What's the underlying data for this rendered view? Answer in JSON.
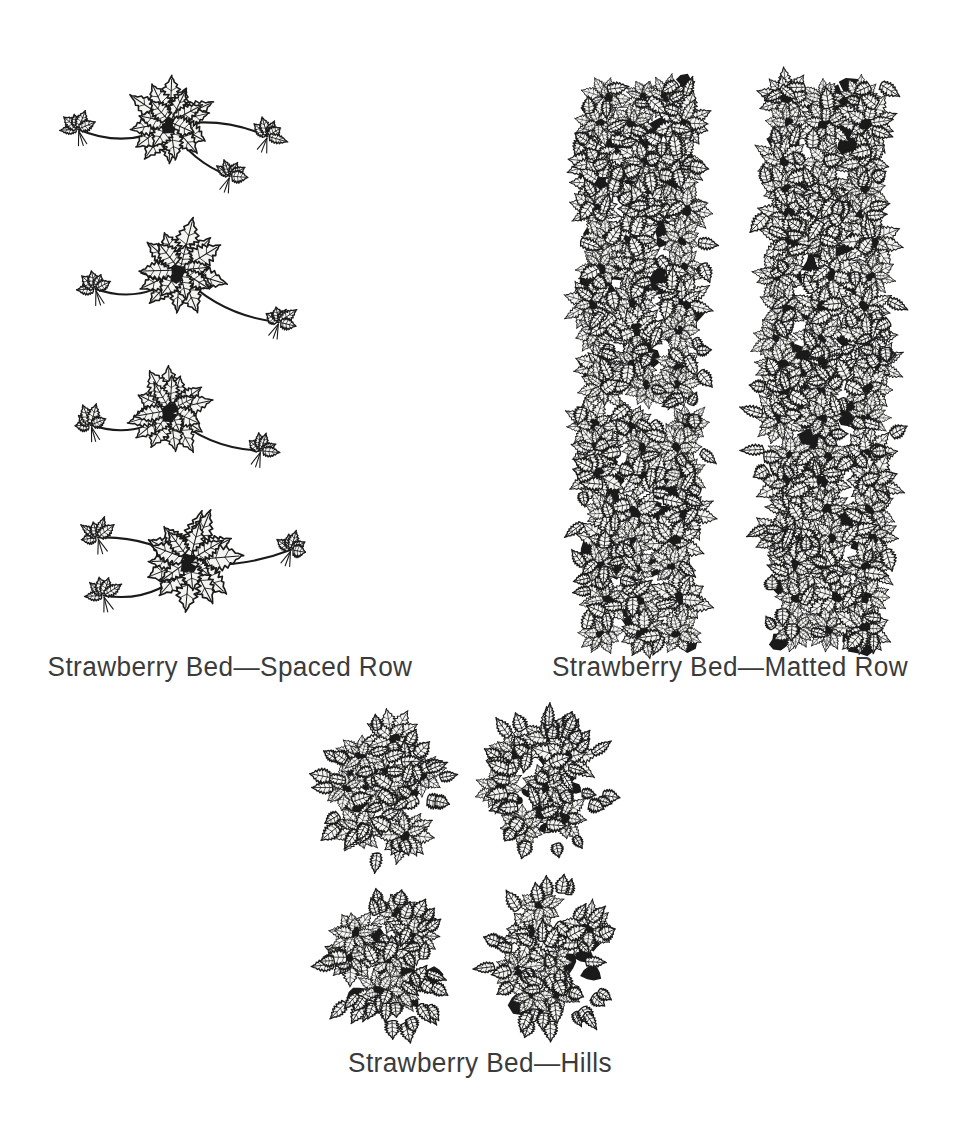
{
  "page": {
    "background_color": "#ffffff",
    "ink_color": "#1a1a1a",
    "text_color": "#3b3b3b",
    "type": "botanical-line-illustration"
  },
  "figures": [
    {
      "id": "spaced-row",
      "caption": "Strawberry Bed—Spaced Row",
      "layout": "vertical-column",
      "plant_count": 4,
      "description": "Four individual strawberry mother plants arranged in a vertical line, each with runners extending to small daughter plantlets",
      "plants": [
        {
          "cx": 110,
          "cy": 62,
          "scale": 1.0,
          "rot": -4,
          "runners": [
            {
              "angle": 178,
              "len": 92,
              "plantlet": 1,
              "bend": -22
            },
            {
              "angle": 6,
              "len": 98,
              "plantlet": 1,
              "bend": -16
            },
            {
              "angle": 40,
              "len": 78,
              "plantlet": 1,
              "bend": 14
            }
          ]
        },
        {
          "cx": 120,
          "cy": 210,
          "scale": 1.02,
          "rot": 6,
          "runners": [
            {
              "angle": 170,
              "len": 86,
              "plantlet": 1,
              "bend": -24
            },
            {
              "angle": 26,
              "len": 110,
              "plantlet": 1,
              "bend": 20
            }
          ]
        },
        {
          "cx": 110,
          "cy": 350,
          "scale": 0.93,
          "rot": -6,
          "runners": [
            {
              "angle": 172,
              "len": 80,
              "plantlet": 1,
              "bend": -20
            },
            {
              "angle": 22,
              "len": 98,
              "plantlet": 1,
              "bend": 18
            }
          ]
        },
        {
          "cx": 130,
          "cy": 500,
          "scale": 1.05,
          "rot": 3,
          "runners": [
            {
              "angle": 160,
              "len": 92,
              "plantlet": 1,
              "bend": -26
            },
            {
              "angle": 196,
              "len": 96,
              "plantlet": 1,
              "bend": 16
            },
            {
              "angle": 352,
              "len": 102,
              "plantlet": 1,
              "bend": 12
            }
          ]
        }
      ]
    },
    {
      "id": "matted-row",
      "caption": "Strawberry Bed—Matted Row",
      "layout": "two-dense-columns",
      "column_count": 2,
      "description": "Two long continuous dense bands of overlapping strawberry foliage forming solid matted rows",
      "columns": [
        {
          "x": 35,
          "y": 22,
          "width": 128,
          "height": 560,
          "density": 150
        },
        {
          "x": 222,
          "y": 22,
          "width": 130,
          "height": 565,
          "density": 152
        }
      ]
    },
    {
      "id": "hills",
      "caption": "Strawberry Bed—Hills",
      "layout": "grid-2x2",
      "clump_count": 4,
      "description": "Four separate rounded clumps of strawberry plants arranged in a two by two grid, runners removed",
      "clumps": [
        {
          "cx": 85,
          "cy": 78,
          "rx": 62,
          "ry": 70,
          "density": 46
        },
        {
          "cx": 245,
          "cy": 76,
          "rx": 62,
          "ry": 72,
          "density": 46
        },
        {
          "cx": 90,
          "cy": 248,
          "rx": 62,
          "ry": 70,
          "density": 46
        },
        {
          "cx": 250,
          "cy": 250,
          "rx": 60,
          "ry": 74,
          "density": 46
        }
      ]
    }
  ]
}
